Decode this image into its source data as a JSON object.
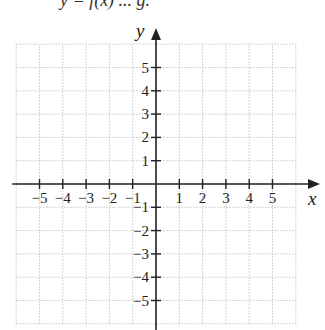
{
  "header": {
    "cut_off_text": "y = f(x) ... g."
  },
  "chart_data": {
    "type": "line",
    "title": "",
    "xlabel": "x",
    "ylabel": "y",
    "xlim": [
      -6,
      6
    ],
    "ylim": [
      -6,
      6
    ],
    "grid": true,
    "grid_style": "dotted",
    "x_ticks": [
      -5,
      -4,
      -3,
      -2,
      -1,
      1,
      2,
      3,
      4,
      5
    ],
    "y_ticks": [
      -5,
      -4,
      -3,
      -2,
      -1,
      1,
      2,
      3,
      4,
      5
    ],
    "x_tick_labels": [
      "−5",
      "−4",
      "−3",
      "−2",
      "−1",
      "1",
      "2",
      "3",
      "4",
      "5"
    ],
    "y_tick_labels": [
      "−5",
      "−4",
      "−3",
      "−2",
      "−1",
      "1",
      "2",
      "3",
      "4",
      "5"
    ],
    "series": []
  },
  "colors": {
    "axis": "#222222",
    "grid": "#b8b8b8"
  }
}
